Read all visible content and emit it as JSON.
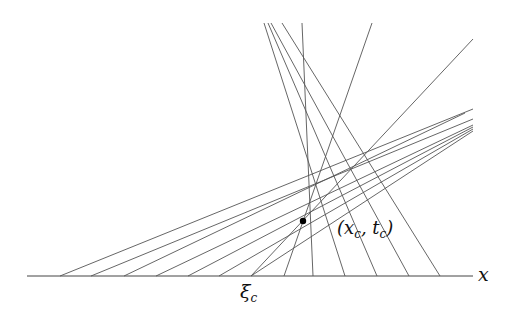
{
  "figure": {
    "type": "characteristics-diagram",
    "axis": {
      "label": "x",
      "y": 276,
      "x_start": 27,
      "x_end": 473
    },
    "shock_point": {
      "label_main": "(x",
      "label_sub1": "c",
      "label_mid": ", t",
      "label_sub2": "c",
      "label_end": ")",
      "x": 303,
      "y": 221
    },
    "xi_label": {
      "main": "ξ",
      "sub": "c"
    },
    "line_color": "#555555",
    "characteristics": [
      {
        "x1": 60,
        "y1": 276,
        "x2": 473,
        "y2": 109
      },
      {
        "x1": 91,
        "y1": 276,
        "x2": 473,
        "y2": 119
      },
      {
        "x1": 124,
        "y1": 276,
        "x2": 465,
        "y2": 113
      },
      {
        "x1": 156,
        "y1": 276,
        "x2": 473,
        "y2": 125
      },
      {
        "x1": 188,
        "y1": 276,
        "x2": 473,
        "y2": 127
      },
      {
        "x1": 219,
        "y1": 276,
        "x2": 473,
        "y2": 129
      },
      {
        "x1": 251,
        "y1": 276,
        "x2": 473,
        "y2": 39
      },
      {
        "x1": 284,
        "y1": 276,
        "x2": 372,
        "y2": 23
      },
      {
        "x1": 313,
        "y1": 276,
        "x2": 302,
        "y2": 23
      },
      {
        "x1": 345,
        "y1": 276,
        "x2": 264,
        "y2": 23
      },
      {
        "x1": 377,
        "y1": 276,
        "x2": 268,
        "y2": 23
      },
      {
        "x1": 409,
        "y1": 276,
        "x2": 271,
        "y2": 23
      },
      {
        "x1": 440,
        "y1": 276,
        "x2": 282,
        "y2": 23
      },
      {
        "x1": 251,
        "y1": 276,
        "x2": 473,
        "y2": 131
      }
    ]
  }
}
